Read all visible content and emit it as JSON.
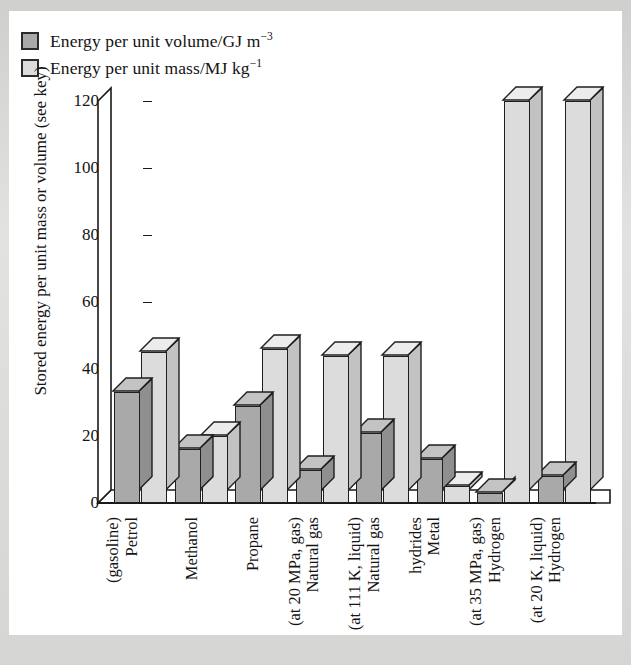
{
  "legend": {
    "items": [
      {
        "swatch": "dark-gray-square",
        "color": "#a9a9a9",
        "label_main": "Energy per unit volume/GJ m",
        "label_sup": "−3"
      },
      {
        "swatch": "light-gray-square",
        "color": "#dcdcdc",
        "label_main": "Energy per unit mass/MJ kg",
        "label_sup": "−1"
      }
    ]
  },
  "axis": {
    "y_title": "Stored energy per unit mass or volume (see key)",
    "y_ticks": [
      "0",
      "20",
      "40",
      "60",
      "80",
      "100",
      "120"
    ]
  },
  "chart_data": {
    "type": "bar",
    "title": "",
    "xlabel": "",
    "ylabel": "Stored energy per unit mass or volume (see key)",
    "ylim": [
      0,
      120
    ],
    "yticks": [
      0,
      20,
      40,
      60,
      80,
      100,
      120
    ],
    "grid": false,
    "legend_position": "top-left",
    "style": "3d-isometric-bars",
    "categories": [
      "Petrol (gasoline)",
      "Methanol",
      "Propane",
      "Natural gas (at 20 MPa, gas)",
      "Natural gas (at 111 K, liquid)",
      "Metal hydrides",
      "Hydrogen (at 35 MPa, gas)",
      "Hydrogen (at 20 K, liquid)"
    ],
    "category_lines": [
      [
        "Petrol",
        "(gasoline)"
      ],
      [
        "Methanol"
      ],
      [
        "Propane"
      ],
      [
        "Natural gas",
        "(at 20 MPa, gas)"
      ],
      [
        "Natural gas",
        "(at 111 K, liquid)"
      ],
      [
        "Metal",
        "hydrides"
      ],
      [
        "Hydrogen",
        "(at 35 MPa, gas)"
      ],
      [
        "Hydrogen",
        "(at 20 K, liquid)"
      ]
    ],
    "series": [
      {
        "name": "Energy per unit volume/GJ m−3",
        "color": "#a9a9a9",
        "values": [
          33,
          16,
          29,
          10,
          21,
          13,
          3,
          8
        ]
      },
      {
        "name": "Energy per unit mass/MJ kg−1",
        "color": "#dcdcdc",
        "values": [
          45,
          20,
          46,
          44,
          44,
          5,
          120,
          120
        ]
      }
    ]
  }
}
